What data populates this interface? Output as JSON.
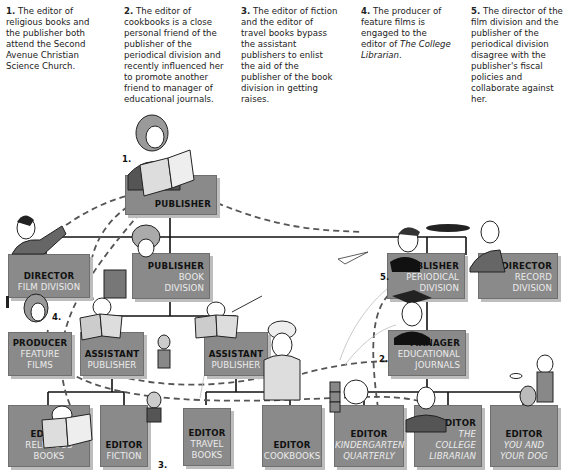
{
  "notes": [
    {
      "num": "1.",
      "text": "The editor of religious books and the publisher both attend the Second Avenue Christian Science Church."
    },
    {
      "num": "2.",
      "text": "The editor of cookbooks is a close personal friend of the publisher of the periodical division and recently influenced her to promote another friend to manager of educational journals."
    },
    {
      "num": "3.",
      "text": "The editor of fiction and the editor of travel books bypass the assistant publishers to enlist the aid of the publisher of the book division in getting raises."
    },
    {
      "num": "4.",
      "text_before": "The producer of feature films is engaged to the editor of ",
      "text_italic": "The College Librarian",
      "text_after": "."
    },
    {
      "num": "5.",
      "text": "The director of the film division and the publisher of the periodical division disagree with the publisher's fiscal policies and collaborate against her."
    }
  ],
  "boxes": {
    "publisher": {
      "title": "PUBLISHER",
      "sub": ""
    },
    "director_film": {
      "title": "DIRECTOR",
      "sub": "FILM DIVISION"
    },
    "publisher_book": {
      "title": "PUBLISHER",
      "sub1": "BOOK",
      "sub2": "DIVISION"
    },
    "publisher_periodical": {
      "title": "PUBLISHER",
      "sub1": "PERIODICAL",
      "sub2": "DIVISION"
    },
    "director_record": {
      "title": "DIRECTOR",
      "sub1": "RECORD",
      "sub2": "DIVISION"
    },
    "producer": {
      "title": "PRODUCER",
      "sub": "FEATURE FILMS"
    },
    "assistant_publisher_1": {
      "title": "ASSISTANT",
      "sub": "PUBLISHER"
    },
    "assistant_publisher_2": {
      "title": "ASSISTANT",
      "sub": "PUBLISHER"
    },
    "manager": {
      "title": "MANAGER",
      "sub1": "EDUCATIONAL",
      "sub2": "JOURNALS"
    },
    "editor_religious": {
      "title": "EDITOR",
      "sub": "RELIGIOUS BOOKS"
    },
    "editor_fiction": {
      "title": "EDITOR",
      "sub": "FICTION"
    },
    "editor_travel": {
      "title": "EDITOR",
      "sub1": "TRAVEL",
      "sub2": "BOOKS"
    },
    "editor_cookbooks": {
      "title": "EDITOR",
      "sub": "COOKBOOKS"
    },
    "editor_kindergarten": {
      "title": "EDITOR",
      "sub1": "KINDERGARTEN",
      "sub2": "QUARTERLY"
    },
    "editor_college": {
      "title": "EDITOR",
      "sub1": "THE",
      "sub2": "COLLEGE",
      "sub3": "LIBRARIAN"
    },
    "editor_dog": {
      "title": "EDITOR",
      "sub1": "YOU AND",
      "sub2": "YOUR DOG"
    }
  },
  "markers": {
    "m1": "1.",
    "m2": "2.",
    "m3": "3.",
    "m4": "4.",
    "m5": "5."
  },
  "props": {
    "publisher_book": "One-Year Soup",
    "religious_book": "Christian Science",
    "fishing_book": "Field & Stream",
    "money_symbol": "$"
  },
  "colors": {
    "box_fill": "#8a8a8a",
    "box_shadow": "#bdbdbd",
    "line": "#111111",
    "dashed": "#555555"
  }
}
